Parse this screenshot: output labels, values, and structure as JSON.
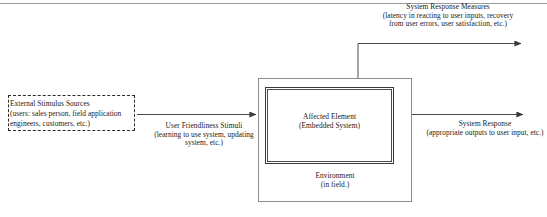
{
  "diagram": {
    "nodes": {
      "stimulus_sources": {
        "label": "External Stimulus Sources\n(users: sales person, field application\nengineers, customers, etc.)",
        "border_style": "dashed",
        "border_color": "#2b2b2b"
      },
      "environment": {
        "label": "Environment\n(in field.)",
        "border_color": "#8c8c8c"
      },
      "affected_element": {
        "label": "Affected Element\n(Embedded System)",
        "border_color": "#3a3a3a"
      }
    },
    "edges": {
      "stimuli": {
        "label": "User Friendliness Stimuli\n(learning to use system, updating\nsystem, etc.)",
        "direction": "right"
      },
      "response_measures": {
        "label": "System Response Measures\n(latency in reacting to user inputs, recovery\nfrom user errors, user satisfaction, etc.)",
        "direction": "up-right"
      },
      "system_response": {
        "label": "System Response\n(appropriate outputs to user input, etc.)",
        "direction": "right"
      }
    },
    "colors": {
      "line": "#4a4a4a",
      "rule": "#9a9a9a",
      "background": "#ffffff",
      "text": "#1a1a1a"
    }
  }
}
